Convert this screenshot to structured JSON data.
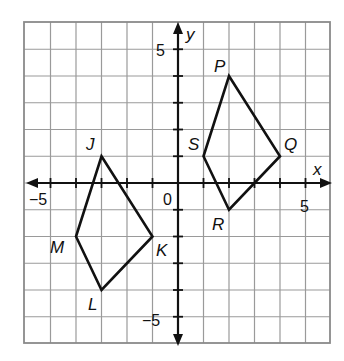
{
  "diagram": {
    "type": "coordinate-plane",
    "x_range": [
      -6,
      6
    ],
    "y_range": [
      -6,
      6
    ],
    "axis_labels": {
      "x": "x",
      "y": "y"
    },
    "tick_labels": {
      "x_neg": "−5",
      "x_pos": "5",
      "y_pos": "5",
      "y_neg": "−5",
      "origin": "0"
    },
    "colors": {
      "grid": "#9a9a9a",
      "ink": "#111111",
      "background": "#ffffff"
    },
    "quadrilaterals": [
      {
        "name": "PQRS",
        "vertices": [
          {
            "label": "P",
            "x": 2,
            "y": 4
          },
          {
            "label": "Q",
            "x": 4,
            "y": 1
          },
          {
            "label": "R",
            "x": 2,
            "y": -1
          },
          {
            "label": "S",
            "x": 1,
            "y": 1
          }
        ]
      },
      {
        "name": "JKLM",
        "vertices": [
          {
            "label": "J",
            "x": -3,
            "y": 1
          },
          {
            "label": "K",
            "x": -1,
            "y": -2
          },
          {
            "label": "L",
            "x": -3,
            "y": -4
          },
          {
            "label": "M",
            "x": -4,
            "y": -2
          }
        ]
      }
    ]
  }
}
